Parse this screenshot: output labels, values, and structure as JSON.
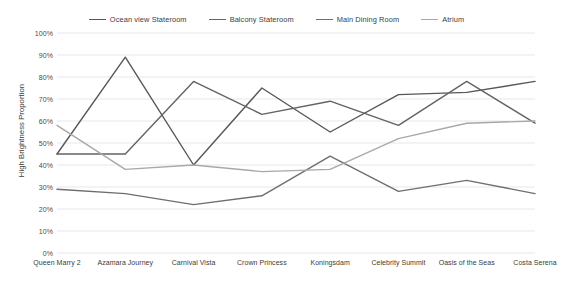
{
  "chart_data": {
    "type": "line",
    "title": "",
    "xlabel": "",
    "ylabel": "High Brightness Proportion",
    "ylim": [
      0,
      100
    ],
    "grid": true,
    "legend_position": "top-center",
    "categories": [
      "Queen Marry 2",
      "Azamara Journey",
      "Carnival Vista",
      "Crown Princess",
      "Koningsdam",
      "Celebrity Summit",
      "Oasis of the Seas",
      "Costa Serena"
    ],
    "y_ticks": [
      "0%",
      "10%",
      "20%",
      "30%",
      "40%",
      "50%",
      "60%",
      "70%",
      "80%",
      "90%",
      "100%"
    ],
    "y_tick_values": [
      0,
      10,
      20,
      30,
      40,
      50,
      60,
      70,
      80,
      90,
      100
    ],
    "series": [
      {
        "name": "Ocean view Stateroom",
        "color": "#575757",
        "values": [
          45,
          89,
          40,
          75,
          55,
          72,
          73,
          78
        ]
      },
      {
        "name": "Balcony Stateroom",
        "color": "#636363",
        "values": [
          45,
          45,
          78,
          63,
          69,
          58,
          78,
          59
        ]
      },
      {
        "name": "Main Dining Room",
        "color": "#6e6e6e",
        "values": [
          29,
          27,
          22,
          26,
          44,
          28,
          33,
          27
        ]
      },
      {
        "name": "Atrium",
        "color": "#a8a8a8",
        "values": [
          58,
          38,
          40,
          37,
          38,
          52,
          59,
          60
        ]
      }
    ]
  },
  "colors": {
    "gridline": "#d6dce8",
    "text": "#3b3b3b",
    "background": "#ffffff"
  }
}
